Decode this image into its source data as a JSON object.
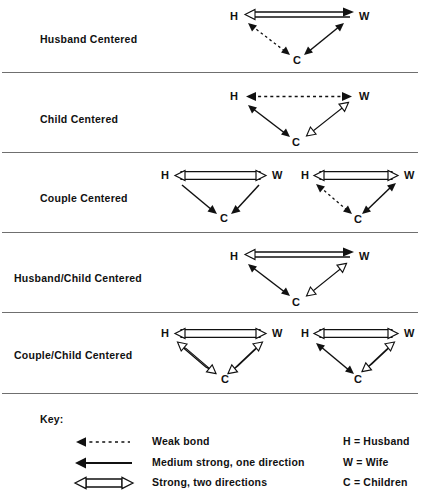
{
  "figure": {
    "rows": [
      {
        "label": "Husband Centered",
        "diagrams": [
          {
            "nodes": {
              "h": "H",
              "w": "W",
              "c": "C"
            },
            "links": {
              "hw": "strong-two-directions",
              "hc": "weak-bond",
              "wc": "medium-strong-two-direction"
            }
          }
        ]
      },
      {
        "label": "Child Centered",
        "diagrams": [
          {
            "nodes": {
              "h": "H",
              "w": "W",
              "c": "C"
            },
            "links": {
              "hw": "weak-bond",
              "hc": "medium-strong-two-direction",
              "wc": "strong-two-directions"
            }
          }
        ]
      },
      {
        "label": "Couple Centered",
        "diagrams": [
          {
            "nodes": {
              "h": "H",
              "w": "W",
              "c": "C"
            },
            "links": {
              "hw": "strong-two-directions",
              "hc": "medium-strong-one-direction",
              "wc": "medium-strong-one-direction"
            }
          },
          {
            "nodes": {
              "h": "H",
              "w": "W",
              "c": "C"
            },
            "links": {
              "hw": "strong-two-directions",
              "hc": "weak-bond",
              "wc": "medium-strong-two-direction"
            }
          }
        ]
      },
      {
        "label": "Husband/Child Centered",
        "diagrams": [
          {
            "nodes": {
              "h": "H",
              "w": "W",
              "c": "C"
            },
            "links": {
              "hw": "strong-two-directions",
              "hc": "medium-strong-two-direction",
              "wc": "strong-two-directions"
            }
          }
        ]
      },
      {
        "label": "Couple/Child Centered",
        "diagrams": [
          {
            "nodes": {
              "h": "H",
              "w": "W",
              "c": "C"
            },
            "links": {
              "hw": "strong-two-directions",
              "hc": "strong-two-directions",
              "wc": "strong-two-directions"
            }
          },
          {
            "nodes": {
              "h": "H",
              "w": "W",
              "c": "C"
            },
            "links": {
              "hw": "strong-two-directions",
              "hc": "medium-strong-two-direction",
              "wc": "strong-two-directions"
            }
          }
        ]
      }
    ]
  },
  "key": {
    "title": "Key:",
    "legend": [
      {
        "symbol": "weak-bond-arrow-icon",
        "label": "Weak bond"
      },
      {
        "symbol": "medium-strong-arrow-icon",
        "label": "Medium strong, one direction"
      },
      {
        "symbol": "strong-double-arrow-icon",
        "label": "Strong, two directions"
      }
    ],
    "abbreviations": [
      "H = Husband",
      "W = Wife",
      "C = Children"
    ]
  },
  "style": {
    "ink": "#111111",
    "rule": "#6f6f6f",
    "paper": "#ffffff"
  }
}
